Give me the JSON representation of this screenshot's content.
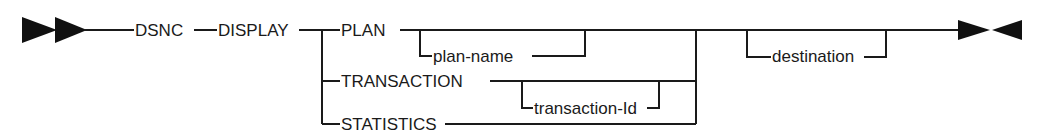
{
  "diagram": {
    "type": "syntax-railroad",
    "command": {
      "keyword1": "DSNC",
      "keyword2": "DISPLAY"
    },
    "options": {
      "plan": {
        "label": "PLAN",
        "param": "plan-name"
      },
      "transaction": {
        "label": "TRANSACTION",
        "param": "transaction-Id"
      },
      "statistics": {
        "label": "STATISTICS"
      }
    },
    "optional_param": "destination",
    "start_marker": "double-right-arrow",
    "end_marker": "right-left-arrow"
  }
}
